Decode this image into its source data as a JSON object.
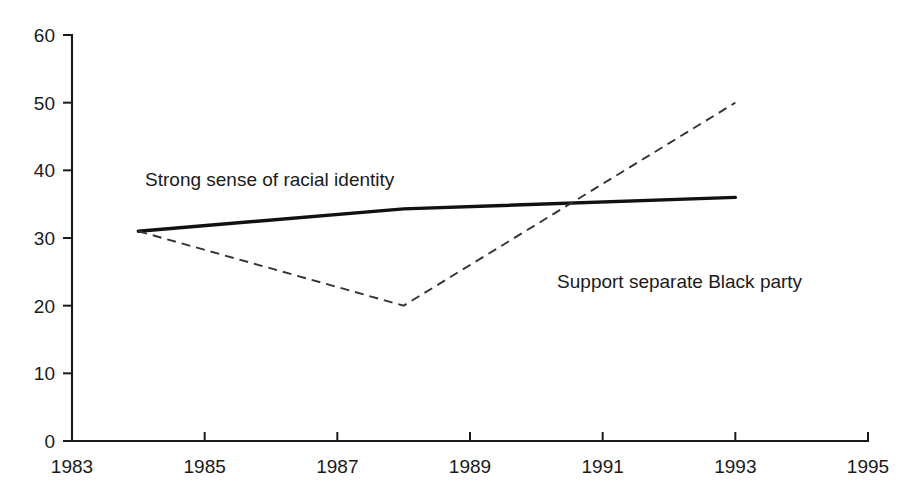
{
  "chart_data": {
    "type": "line",
    "title": "",
    "subtitle": "",
    "xlabel": "",
    "ylabel": "",
    "xlim": [
      1983,
      1995
    ],
    "ylim": [
      0,
      60
    ],
    "x_ticks": [
      1983,
      1985,
      1987,
      1989,
      1991,
      1993,
      1995
    ],
    "x_tick_labels": [
      "1983",
      "1985",
      "1987",
      "1989",
      "1991",
      "1993",
      "1995"
    ],
    "y_ticks": [
      0,
      10,
      20,
      30,
      40,
      50,
      60
    ],
    "y_tick_labels": [
      "0",
      "10",
      "20",
      "30",
      "40",
      "50",
      "60"
    ],
    "grid": false,
    "legend_position": "inline-annotations",
    "series": [
      {
        "name": "Strong sense of racial identity",
        "style": "solid",
        "color": "#111111",
        "x": [
          1984,
          1988,
          1993
        ],
        "values": [
          31,
          34.3,
          36
        ]
      },
      {
        "name": "Support separate Black party",
        "style": "dashed",
        "color": "#333333",
        "x": [
          1984,
          1988,
          1993
        ],
        "values": [
          31,
          20,
          50
        ]
      }
    ],
    "annotations": [
      {
        "text": "Strong sense of racial identity",
        "x": 1985.98,
        "y": 37.7,
        "anchor": "middle"
      },
      {
        "text": "Support separate Black party",
        "x": 1992.16,
        "y": 22.6,
        "anchor": "middle"
      }
    ]
  },
  "axes": {
    "y_axis_name": "y-axis",
    "x_axis_name": "x-axis"
  }
}
